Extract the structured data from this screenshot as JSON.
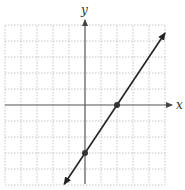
{
  "chart_data": {
    "type": "line",
    "title": "",
    "xlabel": "x",
    "ylabel": "y",
    "xlim": [
      -5,
      5
    ],
    "ylim": [
      -5,
      5
    ],
    "grid": true,
    "grid_style": "dotted",
    "tick_labels": false,
    "series": [
      {
        "name": "line",
        "equation": "y = 1.5x - 3",
        "slope": 1.5,
        "intercept": -3,
        "arrows": "both",
        "x": [
          -1.3,
          5.0
        ],
        "y": [
          -4.95,
          4.5
        ]
      }
    ],
    "points": [
      {
        "label": "x-intercept",
        "x": 2,
        "y": 0
      },
      {
        "label": "y-intercept",
        "x": 0,
        "y": -3
      }
    ]
  },
  "axes": {
    "x_label": "x",
    "y_label": "y"
  },
  "colors": {
    "grid": "#b8b8b8",
    "axis": "#555555",
    "line": "#222222",
    "label": "#333333"
  }
}
